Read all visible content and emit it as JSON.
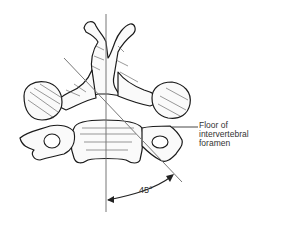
{
  "figure": {
    "labels": {
      "floor_line1": "Floor of",
      "floor_line2": "intervertebral",
      "floor_line3": "foramen",
      "angle": "45°"
    },
    "colors": {
      "outline": "#1a1a1a",
      "guide_line": "#777777",
      "shade": "#555555",
      "background": "#ffffff"
    }
  }
}
